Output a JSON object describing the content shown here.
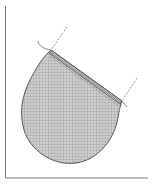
{
  "diagram": {
    "type": "pattern-piece",
    "colors": {
      "background": "#ffffff",
      "outline": "#555555",
      "fill": "#c8c8c8",
      "hatch": "#9a9a9a",
      "axis": "#777777",
      "dashed": "#888888"
    },
    "axes": {
      "vertical": {
        "x": 5.5,
        "y1": 6,
        "y2": 178
      },
      "horizontal": {
        "y": 178,
        "x1": 5.5,
        "x2": 148
      }
    },
    "shape": {
      "top_left_corner": [
        51,
        50
      ],
      "top_right_corner": [
        122,
        101
      ],
      "bottom_point": [
        76,
        163
      ],
      "left_extent": [
        22,
        115
      ]
    },
    "dashed_lines": [
      {
        "from": [
          67,
          27
        ],
        "to": [
          51,
          50
        ]
      },
      {
        "from": [
          137,
          78
        ],
        "to": [
          122,
          101
        ]
      }
    ]
  }
}
